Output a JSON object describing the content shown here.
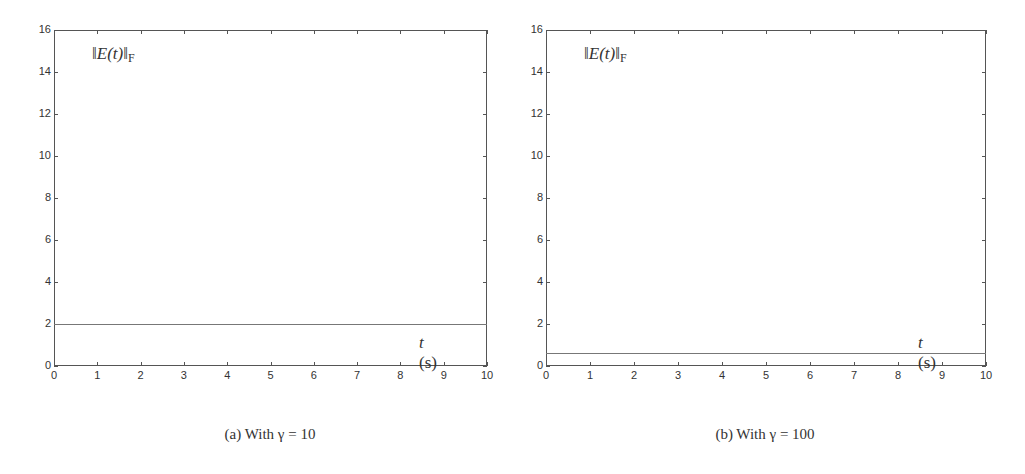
{
  "chart_data": [
    {
      "type": "line",
      "title": "",
      "caption": "(a) With γ = 10",
      "ylabel": "‖E(t)‖F",
      "xlabel": "t (s)",
      "xlim": [
        0,
        10
      ],
      "ylim": [
        0,
        16
      ],
      "xticks": [
        0,
        1,
        2,
        3,
        4,
        5,
        6,
        7,
        8,
        9,
        10
      ],
      "yticks": [
        0,
        2,
        4,
        6,
        8,
        10,
        12,
        14,
        16
      ],
      "grid": false,
      "series": [
        {
          "name": "‖E(t)‖F",
          "x": [
            0,
            10
          ],
          "values": [
            2.0,
            2.0
          ]
        }
      ]
    },
    {
      "type": "line",
      "title": "",
      "caption": "(b) With γ = 100",
      "ylabel": "‖E(t)‖F",
      "xlabel": "t (s)",
      "xlim": [
        0,
        10
      ],
      "ylim": [
        0,
        16
      ],
      "xticks": [
        0,
        1,
        2,
        3,
        4,
        5,
        6,
        7,
        8,
        9,
        10
      ],
      "yticks": [
        0,
        2,
        4,
        6,
        8,
        10,
        12,
        14,
        16
      ],
      "grid": false,
      "series": [
        {
          "name": "‖E(t)‖F",
          "x": [
            0,
            10
          ],
          "values": [
            0.6,
            0.6
          ]
        }
      ]
    }
  ],
  "panels": [
    {
      "ylabel_main": "‖E(t)‖",
      "ylabel_sub": "F",
      "xlabel": "t (s)",
      "caption": "(a) With γ = 10"
    },
    {
      "ylabel_main": "‖E(t)‖",
      "ylabel_sub": "F",
      "xlabel": "t (s)",
      "caption": "(b) With γ = 100"
    }
  ]
}
